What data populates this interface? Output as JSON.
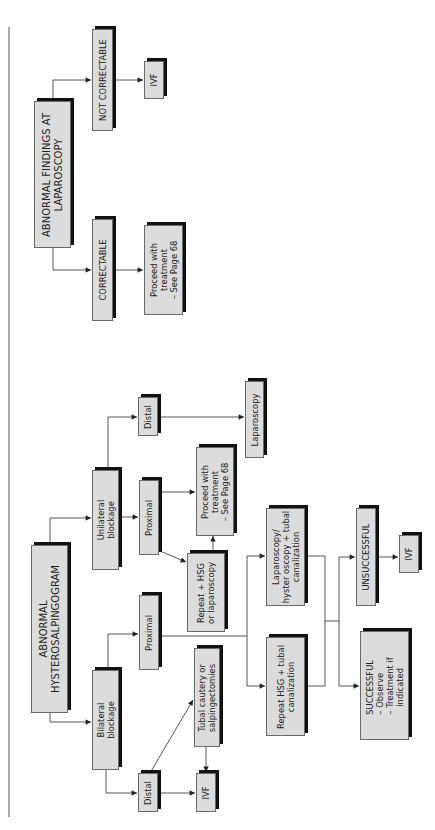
{
  "diagram": {
    "type": "flowchart",
    "orientation": "rotated-90-ccw",
    "colors": {
      "box_fill": "#dcdcdc",
      "box_border": "#6a6a6a",
      "box_shadow": "#111111",
      "line": "#333333"
    },
    "laparoscopy_flow": {
      "root": "ABNORMAL FINDINGS AT\nLAPAROSCOPY",
      "not_correctable": "NOT CORRECTABLE",
      "not_correctable_next": "IVF",
      "correctable": "CORRECTABLE",
      "correctable_next": "Proceed with\ntreatment\n– See Page 68"
    },
    "hsg_flow": {
      "root": "ABNORMAL\nHYSTEROSALPINGOGRAM",
      "unilateral": "Unilateral\nblockage",
      "bilateral": "Bilateral\nblockage",
      "uni_distal": "Distal",
      "uni_distal_next": "Laparoscopy",
      "uni_proximal": "Proximal",
      "uni_proximal_treatment": "Proceed with\ntreatment\n– See Page 68",
      "uni_proximal_repeat": "Repeat + HSG\nor laparoscopy",
      "bi_proximal": "Proximal",
      "bi_distal": "Distal",
      "bi_distal_cautery": "Tubal cautery or\nsalpingectomies",
      "bi_distal_ivf": "IVF",
      "lap_hyst": "Laparoscopy/\nhyster oscopy + tubal\ncanalization",
      "repeat_hsg_tubal": "Repeat HSG + tubal\ncanalization",
      "unsuccessful": "UNSUCCESSFUL",
      "unsuccessful_next": "IVF",
      "successful": "SUCCESSFUL\n– Observe\n– Treatment if\n   indicated"
    }
  }
}
